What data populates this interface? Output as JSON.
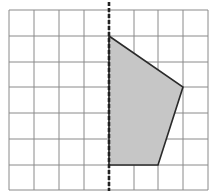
{
  "diagram": {
    "type": "grid-reflection",
    "grid": {
      "columns": 8,
      "rows": 7,
      "x_lines": [
        9,
        34,
        59,
        84,
        109,
        134,
        158,
        183,
        208
      ],
      "y_lines": [
        10,
        36,
        62,
        87,
        113,
        139,
        165,
        190
      ],
      "line_color": "#8a8a8a"
    },
    "mirror_line": {
      "orientation": "vertical",
      "grid_column_index": 4,
      "x": 109,
      "style": "dashed",
      "color": "#222222"
    },
    "shape": {
      "name": "quadrilateral",
      "grid_vertices": [
        [
          4,
          1
        ],
        [
          7,
          3
        ],
        [
          6,
          6
        ],
        [
          4,
          6
        ]
      ],
      "pixel_vertices": [
        [
          109,
          36
        ],
        [
          183,
          87
        ],
        [
          158,
          165
        ],
        [
          109,
          165
        ]
      ],
      "fill": "#c6c6c6",
      "stroke": "#2a2a2a"
    }
  }
}
